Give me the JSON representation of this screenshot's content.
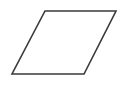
{
  "diagram": {
    "shape": "parallelogram",
    "stroke_color": "#3a3a3a",
    "fill_color": "#ffffff",
    "background": "#ffffff",
    "points": "45,11 116,11 84,74 12,74",
    "stroke_width": "1.6"
  }
}
